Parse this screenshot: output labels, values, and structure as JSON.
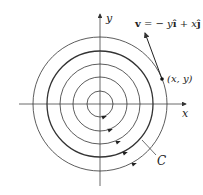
{
  "diagram": {
    "center": [
      100,
      104
    ],
    "radii": [
      13,
      27,
      40,
      53,
      67
    ],
    "highlight_radius_index": 3,
    "labels": {
      "x_axis": "x",
      "y_axis": "y",
      "point": "(x, y)",
      "curve": "C",
      "field_v": "v",
      "field_eq": " = − y",
      "field_i": "î",
      "field_plus": " + x",
      "field_j": "ĵ"
    },
    "colors": {
      "stroke": "#333333",
      "text": "#222222"
    }
  }
}
